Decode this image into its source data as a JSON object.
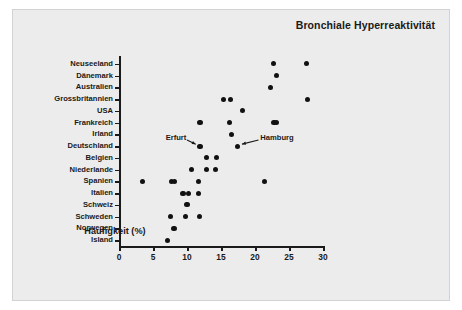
{
  "chart_data": {
    "type": "scatter",
    "title": "Bronchiale Hyperreaktivität",
    "xlabel": "Häufigkeit (%)",
    "ylabel": "",
    "xlim": [
      0,
      30
    ],
    "xticks": [
      0,
      5,
      10,
      15,
      20,
      25,
      30
    ],
    "xtick_labels": [
      "0",
      "5",
      "10",
      "15",
      "20",
      "25",
      "30"
    ],
    "grid": false,
    "legend": "none",
    "categories": [
      "Neuseeland",
      "Dänemark",
      "Australien",
      "Grossbritannien",
      "USA",
      "Frankreich",
      "Irland",
      "Deutschland",
      "Belgien",
      "Niederlande",
      "Spanien",
      "Italien",
      "Schweiz",
      "Schweden",
      "Norwegen",
      "Island"
    ],
    "points": [
      {
        "category": "Neuseeland",
        "value": 22.7
      },
      {
        "category": "Neuseeland",
        "value": 27.6
      },
      {
        "category": "Dänemark",
        "value": 23.2
      },
      {
        "category": "Australien",
        "value": 22.3
      },
      {
        "category": "Grossbritannien",
        "value": 15.4
      },
      {
        "category": "Grossbritannien",
        "value": 16.4
      },
      {
        "category": "Grossbritannien",
        "value": 27.7
      },
      {
        "category": "USA",
        "value": 18.2
      },
      {
        "category": "Frankreich",
        "value": 11.9
      },
      {
        "category": "Frankreich",
        "value": 16.3
      },
      {
        "category": "Frankreich",
        "value": 22.8
      },
      {
        "category": "Frankreich",
        "value": 23.2
      },
      {
        "category": "Irland",
        "value": 16.5
      },
      {
        "category": "Deutschland",
        "value": 11.9
      },
      {
        "category": "Deutschland",
        "value": 17.4
      },
      {
        "category": "Belgien",
        "value": 12.9
      },
      {
        "category": "Belgien",
        "value": 14.3
      },
      {
        "category": "Niederlande",
        "value": 10.7
      },
      {
        "category": "Niederlande",
        "value": 12.9
      },
      {
        "category": "Niederlande",
        "value": 14.2
      },
      {
        "category": "Spanien",
        "value": 3.4
      },
      {
        "category": "Spanien",
        "value": 7.7
      },
      {
        "category": "Spanien",
        "value": 8.2
      },
      {
        "category": "Spanien",
        "value": 11.7
      },
      {
        "category": "Spanien",
        "value": 21.4
      },
      {
        "category": "Italien",
        "value": 9.4
      },
      {
        "category": "Italien",
        "value": 10.2
      },
      {
        "category": "Italien",
        "value": 11.7
      },
      {
        "category": "Schweiz",
        "value": 10.0
      },
      {
        "category": "Schweden",
        "value": 7.6
      },
      {
        "category": "Schweden",
        "value": 9.8
      },
      {
        "category": "Schweden",
        "value": 11.8
      },
      {
        "category": "Norwegen",
        "value": 8.1
      },
      {
        "category": "Island",
        "value": 7.1
      }
    ],
    "annotations": [
      {
        "label": "Erfurt",
        "target_category": "Deutschland",
        "target_value": 11.9,
        "label_x_pct": 10.1,
        "label_row": 6.35
      },
      {
        "label": "Hamburg",
        "target_category": "Deutschland",
        "target_value": 17.4,
        "label_x_pct": 19.9,
        "label_row": 6.35
      }
    ]
  },
  "colors": {
    "figure_background": "#ececec",
    "page_background": "#ffffff",
    "marker": "#111111",
    "axis": "#1a1a1a",
    "text": "#1a1a1a"
  }
}
